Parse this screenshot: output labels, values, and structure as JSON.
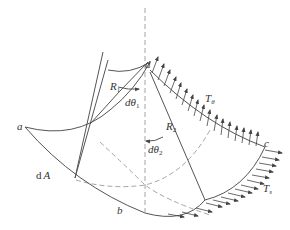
{
  "figure": {
    "colors": {
      "line": "#555555",
      "dashed": "#9a9a9a",
      "arrow": "#444444",
      "text": "#333333"
    },
    "labels": {
      "a": "a",
      "b": "b",
      "c": "c",
      "d": "d",
      "dA_d": "d",
      "dA_A": "A",
      "R1_main": "R",
      "R1_sub": "1",
      "R2_main": "R",
      "R2_sub": "2",
      "dtheta1_d": "dθ",
      "dtheta1_sub": "1",
      "dtheta2_d": "dθ",
      "dtheta2_sub": "2",
      "T_theta_main": "T",
      "T_theta_sub": "θ",
      "T_s_main": "T",
      "T_s_sub": "s"
    }
  }
}
